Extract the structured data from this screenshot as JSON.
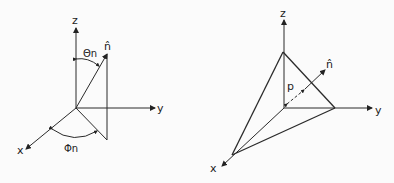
{
  "left_diagram": {
    "axes": {
      "x": "x",
      "y": "y",
      "z": "z"
    },
    "vector_label": "n̂",
    "theta_label": "Θn",
    "phi_label": "Φn"
  },
  "right_diagram": {
    "axes": {
      "x": "x",
      "y": "y",
      "z": "z"
    },
    "vector_label": "n̂",
    "distance_label": "p"
  },
  "colors": {
    "line": "#2a2a2a",
    "background": "#fbfbfb"
  }
}
